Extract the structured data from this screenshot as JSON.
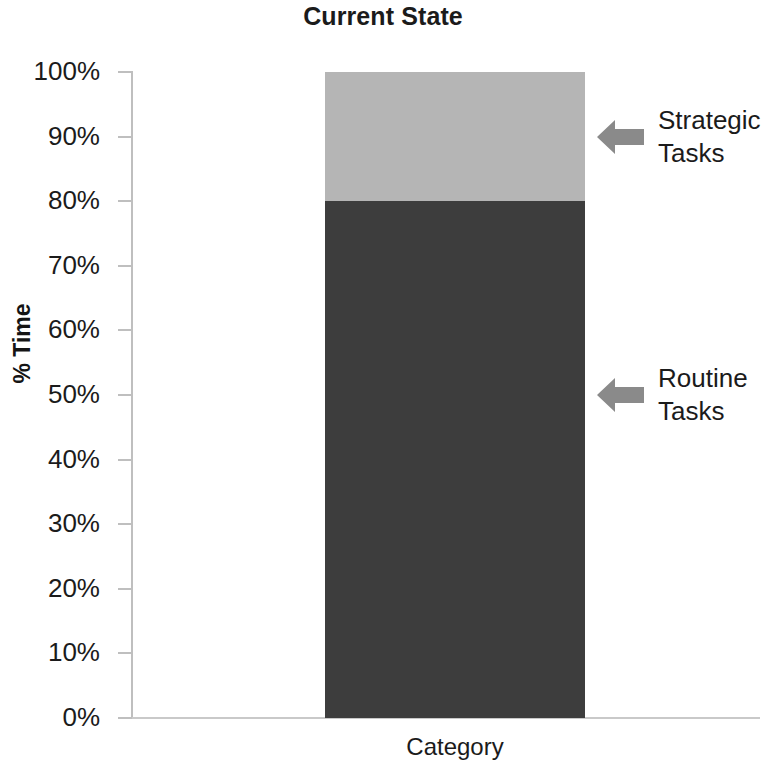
{
  "chart_data": {
    "type": "bar",
    "subtype": "stacked-column",
    "title": "Current State",
    "xlabel": "Category",
    "ylabel": "% Time",
    "categories": [
      "Category"
    ],
    "series": [
      {
        "name": "Routine Tasks",
        "values": [
          80
        ],
        "color": "#3d3d3d"
      },
      {
        "name": "Strategic Tasks",
        "values": [
          20
        ],
        "color": "#b5b5b5"
      }
    ],
    "ylim": [
      0,
      100
    ],
    "ytick_values": [
      100,
      90,
      80,
      70,
      60,
      50,
      40,
      30,
      20,
      10,
      0
    ],
    "ytick_labels": [
      "100%",
      "90%",
      "80%",
      "70%",
      "60%",
      "50%",
      "40%",
      "30%",
      "20%",
      "10%",
      "0%"
    ],
    "grid": false,
    "legend": "none",
    "annotations": [
      {
        "text": "Strategic\nTasks",
        "target_value": 90,
        "icon": "left-arrow-icon"
      },
      {
        "text": "Routine\nTasks",
        "target_value": 50,
        "icon": "left-arrow-icon"
      }
    ]
  },
  "colors": {
    "routine": "#3d3d3d",
    "strategic": "#b5b5b5",
    "arrow": "#8a8a8a",
    "axis": "#bfbfbf",
    "text": "#1b1b1b"
  }
}
